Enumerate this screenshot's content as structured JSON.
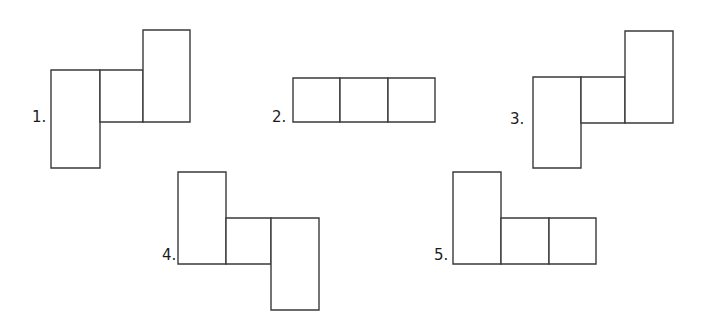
{
  "page": {
    "background_color": "#ffffff",
    "line_color": "#3a3a3a",
    "fill_color": "#ffffff",
    "text_color": "#1b1b1b",
    "width": 703,
    "height": 325
  },
  "figures": [
    {
      "id": "figure-1",
      "label": "1.",
      "label_x": 32,
      "label_y": 110,
      "description": "L-tromino net: tall rectangle at left, square to its upper right, tall rectangle rising at far right",
      "rects": [
        {
          "name": "left-tall-rect",
          "x": 51,
          "y": 70,
          "w": 49,
          "h": 98
        },
        {
          "name": "middle-square",
          "x": 100,
          "y": 70,
          "w": 43,
          "h": 52
        },
        {
          "name": "right-tall-rect",
          "x": 143,
          "y": 30,
          "w": 47,
          "h": 92
        }
      ]
    },
    {
      "id": "figure-2",
      "label": "2.",
      "label_x": 272,
      "label_y": 110,
      "description": "Straight tromino net: three squares in a horizontal row",
      "rects": [
        {
          "name": "square-left",
          "x": 293,
          "y": 78,
          "w": 47,
          "h": 44
        },
        {
          "name": "square-middle",
          "x": 340,
          "y": 78,
          "w": 48,
          "h": 44
        },
        {
          "name": "square-right",
          "x": 388,
          "y": 78,
          "w": 47,
          "h": 44
        }
      ]
    },
    {
      "id": "figure-3",
      "label": "3.",
      "label_x": 510,
      "label_y": 112,
      "description": "L-tromino net: tall rectangle at left, square to its upper right, tall rectangle rising at far right",
      "rects": [
        {
          "name": "left-tall-rect",
          "x": 533,
          "y": 77,
          "w": 48,
          "h": 91
        },
        {
          "name": "middle-square",
          "x": 581,
          "y": 77,
          "w": 44,
          "h": 46
        },
        {
          "name": "right-tall-rect",
          "x": 625,
          "y": 31,
          "w": 48,
          "h": 92
        }
      ]
    },
    {
      "id": "figure-4",
      "label": "4.",
      "label_x": 162,
      "label_y": 248,
      "description": "Zig-zag tromino net: tall rectangle up at left, square at middle-bottom, tall rectangle dropping at right",
      "rects": [
        {
          "name": "left-tall-rect",
          "x": 178,
          "y": 172,
          "w": 48,
          "h": 92
        },
        {
          "name": "middle-square",
          "x": 226,
          "y": 218,
          "w": 45,
          "h": 46
        },
        {
          "name": "right-tall-rect",
          "x": 271,
          "y": 218,
          "w": 48,
          "h": 92
        }
      ]
    },
    {
      "id": "figure-5",
      "label": "5.",
      "label_x": 434,
      "label_y": 248,
      "description": "L-tromino net: tall rectangle standing at left with two squares extending to the right along the bottom",
      "rects": [
        {
          "name": "left-tall-rect",
          "x": 453,
          "y": 172,
          "w": 48,
          "h": 92
        },
        {
          "name": "bottom-square-middle",
          "x": 501,
          "y": 218,
          "w": 48,
          "h": 46
        },
        {
          "name": "bottom-square-right",
          "x": 549,
          "y": 218,
          "w": 47,
          "h": 46
        }
      ]
    }
  ]
}
